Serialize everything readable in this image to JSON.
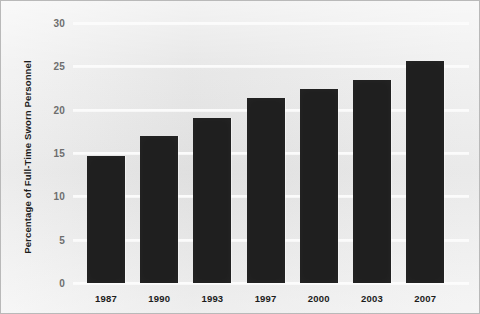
{
  "chart_data": {
    "type": "bar",
    "title": "",
    "subtitle": "",
    "xlabel": "",
    "ylabel": "Percentage of Full-Time Sworn Personnel",
    "categories": [
      "1987",
      "1990",
      "1993",
      "1997",
      "2000",
      "2003",
      "2007"
    ],
    "values": [
      14.6,
      17.0,
      19.0,
      21.3,
      22.4,
      23.4,
      25.6
    ],
    "series": [
      {
        "name": "Percentage of Full-Time Sworn Personnel",
        "values": [
          14.6,
          17.0,
          19.0,
          21.3,
          22.4,
          23.4,
          25.6
        ]
      }
    ],
    "ylim": [
      0,
      30
    ],
    "yticks": [
      0,
      5,
      10,
      15,
      20,
      25,
      30
    ],
    "ytick_labels": [
      "0",
      "5",
      "10",
      "15",
      "20",
      "25",
      "30"
    ],
    "grid": true,
    "grid_axis": "y",
    "legend": false,
    "legend_position": "none",
    "bar_color": "#1f1f1f",
    "background_color": "#e9e9e9",
    "gridline_color": "#fbfbfb",
    "tick_label_color": "#6e6e6e",
    "axis_label_color": "#1c1c1c"
  }
}
